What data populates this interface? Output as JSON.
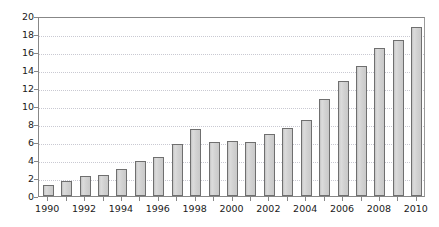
{
  "chart_data": {
    "type": "bar",
    "title": "",
    "subtitle": "",
    "xlabel": "",
    "ylabel": "",
    "ylim": [
      0,
      20
    ],
    "ytick_step": 2,
    "yticks": [
      0,
      2,
      4,
      6,
      8,
      10,
      12,
      14,
      16,
      18,
      20
    ],
    "ytick_labels": [
      "0",
      "2",
      "4",
      "6",
      "8",
      "10",
      "12",
      "14",
      "16",
      "18",
      "20"
    ],
    "xtick_labels": [
      "1990",
      "1992",
      "1994",
      "1996",
      "1998",
      "2000",
      "2002",
      "2004",
      "2006",
      "2008",
      "2010"
    ],
    "xtick_step": 2,
    "grid": true,
    "grid_axis": "y",
    "grid_style": "dotted",
    "legend": null,
    "legend_position": "none",
    "annotations": [],
    "categories": [
      "1990",
      "1991",
      "1992",
      "1993",
      "1994",
      "1995",
      "1996",
      "1997",
      "1998",
      "1999",
      "2000",
      "2001",
      "2002",
      "2003",
      "2004",
      "2005",
      "2006",
      "2007",
      "2008",
      "2009",
      "2010"
    ],
    "values": [
      1.2,
      1.7,
      2.2,
      2.3,
      3.0,
      3.9,
      4.3,
      5.8,
      7.4,
      6.0,
      6.1,
      6.0,
      6.9,
      7.6,
      8.5,
      10.8,
      12.8,
      14.5,
      16.4,
      17.3,
      18.8
    ],
    "series": [
      {
        "name": "",
        "values": [
          1.2,
          1.7,
          2.2,
          2.3,
          3.0,
          3.9,
          4.3,
          5.8,
          7.4,
          6.0,
          6.1,
          6.0,
          6.9,
          7.6,
          8.5,
          10.8,
          12.8,
          14.5,
          16.4,
          17.3,
          18.8
        ]
      }
    ]
  },
  "style": {
    "bar_fill": "#d4d4d4",
    "bar_border": "#6f6f6f",
    "axis_color": "#878787",
    "grid_color": "#c9c9d2",
    "text_color": "#1a1a1a",
    "background": "#ffffff"
  }
}
